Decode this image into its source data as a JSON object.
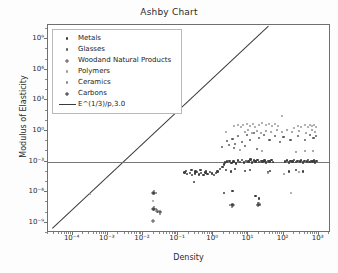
{
  "chart_data": {
    "type": "scatter",
    "title": "Ashby Chart",
    "xlabel": "Density",
    "ylabel": "Modulus of Elasticity",
    "xscale": "log",
    "yscale": "log",
    "xlim": [
      2e-05,
      3000
    ],
    "ylim": [
      1e-10,
      30000000000.0
    ],
    "grid": false,
    "legend_position": "upper left",
    "xticks": [
      "10⁻⁴",
      "10⁻³",
      "10⁻²",
      "10⁻¹",
      "10⁰",
      "10¹",
      "10²",
      "10³"
    ],
    "xtick_values": [
      -4,
      -3,
      -2,
      -1,
      0,
      1,
      2,
      3
    ],
    "yticks": [
      "10⁹",
      "10⁶",
      "10³",
      "10⁰",
      "10⁻³",
      "10⁻⁶",
      "10⁻⁹"
    ],
    "ytick_values": [
      9,
      6,
      3,
      0,
      -3,
      -6,
      -9
    ],
    "series": [
      {
        "name": "Metals",
        "marker": "circle",
        "color": "#3d3d3d",
        "size": 2.4,
        "points": [
          [
            -0.82,
            -4.05
          ],
          [
            -0.74,
            -4.2
          ],
          [
            -0.66,
            -4.1
          ],
          [
            -0.6,
            -4.3
          ],
          [
            -0.52,
            -4.15
          ],
          [
            -0.46,
            -4.0
          ],
          [
            -0.4,
            -4.25
          ],
          [
            -0.34,
            -4.12
          ],
          [
            -0.28,
            -4.3
          ],
          [
            -0.22,
            -4.05
          ],
          [
            -0.16,
            -4.2
          ],
          [
            -0.1,
            -4.0
          ],
          [
            -0.04,
            -4.18
          ],
          [
            0.02,
            -4.3
          ],
          [
            0.08,
            -4.1
          ],
          [
            -0.78,
            -3.9
          ],
          [
            -0.62,
            -3.85
          ],
          [
            -0.5,
            -3.95
          ],
          [
            -0.36,
            -3.8
          ],
          [
            -0.2,
            -3.9
          ],
          [
            0.12,
            -3.95
          ],
          [
            0.2,
            -3.7
          ],
          [
            0.26,
            -3.55
          ],
          [
            0.3,
            -3.3
          ],
          [
            0.34,
            -3.1
          ],
          [
            0.4,
            -3.0
          ],
          [
            0.46,
            -2.95
          ],
          [
            0.52,
            -3.15
          ],
          [
            0.58,
            -3.0
          ],
          [
            0.64,
            -3.2
          ],
          [
            0.7,
            -2.9
          ],
          [
            0.76,
            -3.05
          ],
          [
            0.82,
            -2.85
          ],
          [
            0.88,
            -3.1
          ],
          [
            0.94,
            -2.95
          ],
          [
            1.0,
            -3.0
          ],
          [
            1.06,
            -2.8
          ],
          [
            1.1,
            -3.1
          ],
          [
            1.16,
            -2.9
          ],
          [
            1.2,
            -3.0
          ],
          [
            1.26,
            -2.85
          ],
          [
            1.3,
            -3.05
          ],
          [
            1.36,
            -2.95
          ],
          [
            1.4,
            -3.0
          ],
          [
            1.46,
            -2.9
          ],
          [
            1.5,
            -3.1
          ],
          [
            1.56,
            -2.95
          ],
          [
            1.6,
            -3.0
          ],
          [
            1.66,
            -2.85
          ],
          [
            1.7,
            -3.05
          ],
          [
            2.05,
            -3.0
          ],
          [
            2.1,
            -2.9
          ],
          [
            2.16,
            -3.1
          ],
          [
            2.2,
            -2.95
          ],
          [
            2.26,
            -3.0
          ],
          [
            2.3,
            -2.85
          ],
          [
            2.36,
            -3.05
          ],
          [
            2.4,
            -2.95
          ],
          [
            2.46,
            -3.0
          ],
          [
            2.5,
            -2.9
          ],
          [
            2.56,
            -3.1
          ],
          [
            2.6,
            -2.95
          ],
          [
            2.66,
            -3.0
          ],
          [
            2.7,
            -2.85
          ],
          [
            2.74,
            -3.05
          ],
          [
            2.78,
            -2.95
          ],
          [
            2.82,
            -3.0
          ],
          [
            2.86,
            -2.9
          ],
          [
            2.9,
            -3.1
          ],
          [
            2.94,
            -2.95
          ],
          [
            0.36,
            -3.85
          ],
          [
            0.5,
            -3.95
          ],
          [
            0.62,
            -3.75
          ],
          [
            0.9,
            -3.9
          ],
          [
            1.05,
            -3.85
          ],
          [
            1.55,
            -4.0
          ],
          [
            1.62,
            -3.9
          ],
          [
            2.15,
            -3.95
          ],
          [
            2.35,
            -3.85
          ],
          [
            2.55,
            -3.95
          ],
          [
            -0.55,
            -5.0
          ],
          [
            0.3,
            -6.1
          ],
          [
            0.55,
            -5.9
          ],
          [
            1.2,
            -6.4
          ],
          [
            1.3,
            -6.6
          ]
        ]
      },
      {
        "name": "Glasses",
        "marker": "circle",
        "color": "#5a5a5a",
        "size": 2.2,
        "points": [
          [
            0.4,
            -1.0
          ],
          [
            0.55,
            -0.8
          ],
          [
            0.62,
            -1.3
          ],
          [
            0.7,
            -0.5
          ],
          [
            0.82,
            -1.1
          ],
          [
            0.95,
            -0.4
          ],
          [
            1.05,
            -0.9
          ],
          [
            1.15,
            -0.2
          ],
          [
            1.3,
            -0.7
          ],
          [
            1.45,
            -0.35
          ],
          [
            1.6,
            -0.9
          ],
          [
            1.75,
            -0.45
          ],
          [
            1.9,
            -1.1
          ],
          [
            2.0,
            -0.6
          ],
          [
            2.2,
            -0.85
          ],
          [
            2.4,
            -0.5
          ],
          [
            2.6,
            -0.9
          ],
          [
            2.75,
            -0.35
          ],
          [
            2.85,
            -0.7
          ],
          [
            2.92,
            -0.45
          ],
          [
            0.25,
            -1.6
          ],
          [
            0.45,
            -1.4
          ],
          [
            0.6,
            -1.7
          ],
          [
            0.9,
            -1.5
          ],
          [
            1.25,
            -1.8
          ]
        ]
      },
      {
        "name": "Woodand Natural Products",
        "marker": "plus",
        "color": "#555555",
        "size": 4,
        "points": [
          [
            -1.72,
            -6.05
          ],
          [
            -1.72,
            -7.6
          ],
          [
            -1.6,
            -7.85
          ],
          [
            -1.72,
            -8.85
          ],
          [
            0.55,
            -7.3
          ],
          [
            1.3,
            -7.2
          ]
        ]
      },
      {
        "name": "Polymers",
        "marker": "circle",
        "color": "#9a9a9a",
        "size": 2.0,
        "points": [
          [
            0.6,
            0.45
          ],
          [
            0.7,
            0.6
          ],
          [
            0.78,
            0.35
          ],
          [
            0.85,
            0.55
          ],
          [
            0.95,
            0.7
          ],
          [
            1.05,
            0.5
          ],
          [
            1.12,
            0.65
          ],
          [
            1.2,
            0.4
          ],
          [
            1.3,
            0.6
          ],
          [
            1.4,
            0.75
          ],
          [
            1.5,
            0.55
          ],
          [
            1.6,
            0.7
          ],
          [
            1.68,
            0.5
          ],
          [
            1.75,
            0.65
          ],
          [
            1.85,
            0.45
          ],
          [
            2.3,
            0.3
          ],
          [
            2.4,
            0.5
          ],
          [
            2.5,
            0.35
          ],
          [
            2.6,
            0.55
          ],
          [
            2.7,
            0.4
          ],
          [
            2.75,
            0.6
          ],
          [
            2.82,
            0.45
          ],
          [
            2.88,
            0.55
          ],
          [
            2.93,
            0.35
          ],
          [
            1.95,
            1.5
          ],
          [
            0.35,
            -0.1
          ],
          [
            -3.5,
            -6.2
          ],
          [
            -1.72,
            -6.9
          ],
          [
            2.2,
            -6.1
          ]
        ]
      },
      {
        "name": "Ceramics",
        "marker": "circle",
        "color": "#8c8c8c",
        "size": 2.0,
        "points": [
          [
            0.9,
            -0.05
          ],
          [
            1.0,
            0.1
          ],
          [
            1.1,
            -0.15
          ],
          [
            1.25,
            0.05
          ],
          [
            1.35,
            -0.2
          ],
          [
            1.5,
            0.0
          ],
          [
            1.65,
            -0.1
          ],
          [
            1.8,
            0.1
          ],
          [
            1.95,
            -0.05
          ],
          [
            2.1,
            0.15
          ],
          [
            2.25,
            -0.1
          ],
          [
            2.45,
            0.05
          ],
          [
            2.65,
            -0.15
          ],
          [
            2.8,
            0.1
          ],
          [
            2.9,
            -0.05
          ],
          [
            0.75,
            -1.9
          ],
          [
            1.4,
            -2.0
          ],
          [
            2.35,
            -2.1
          ],
          [
            2.6,
            -2.0
          ],
          [
            2.85,
            -1.95
          ],
          [
            1.55,
            -4.1
          ],
          [
            2.0,
            -4.2
          ],
          [
            2.45,
            -4.05
          ]
        ]
      },
      {
        "name": "Carbons",
        "marker": "plus",
        "color": "#2e2e2e",
        "size": 5,
        "points": [
          [
            -1.68,
            -6.05
          ],
          [
            -1.68,
            -7.6
          ],
          [
            -1.52,
            -7.95
          ],
          [
            0.52,
            -7.3
          ],
          [
            1.28,
            -7.25
          ]
        ]
      }
    ],
    "lines": [
      {
        "name": "E^(1/3)/p,3.0",
        "label": "E^(1/3)/p,3.0",
        "color": "#3a3a3a",
        "kind": "diagonal",
        "from": [
          -4.6,
          -9.55
        ],
        "to": [
          1.55,
          10.3
        ]
      },
      {
        "name": "modulus-threshold-line",
        "label": "",
        "color": "#777777",
        "kind": "horizontal",
        "y": -3.0
      }
    ]
  },
  "legend": {
    "items": [
      {
        "label": "Metals",
        "marker": "circle",
        "color": "#3d3d3d"
      },
      {
        "label": "Glasses",
        "marker": "circle",
        "color": "#5a5a5a"
      },
      {
        "label": "Woodand Natural Products",
        "marker": "plus",
        "color": "#555555"
      },
      {
        "label": "Polymers",
        "marker": "circle",
        "color": "#9a9a9a"
      },
      {
        "label": "Ceramics",
        "marker": "circle",
        "color": "#8c8c8c"
      },
      {
        "label": "Carbons",
        "marker": "plus",
        "color": "#2e2e2e"
      },
      {
        "label": "E^(1/3)/p,3.0",
        "marker": "line",
        "color": "#3a3a3a"
      }
    ]
  }
}
